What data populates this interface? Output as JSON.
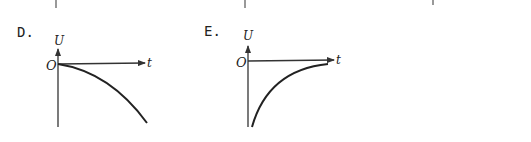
{
  "options": [
    {
      "id": "D",
      "label": "D.",
      "y_axis_label": "U",
      "x_axis_label": "t",
      "origin_label": "O",
      "curve_description": "starts at origin, decreases with increasing steepness (concave down)"
    },
    {
      "id": "E",
      "label": "E.",
      "y_axis_label": "U",
      "x_axis_label": "t",
      "origin_label": "O",
      "curve_description": "starts at large negative value, rises and asymptotically approaches zero"
    }
  ],
  "colors": {
    "ink": "#222222",
    "background": "#ffffff"
  }
}
